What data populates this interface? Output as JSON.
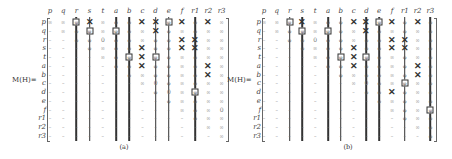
{
  "figure": {
    "matrix_label": "M(H)=",
    "columns": [
      "p",
      "q",
      "r",
      "s",
      "t",
      "a",
      "b",
      "c",
      "d",
      "e",
      "f",
      "r1",
      "r2",
      "r3"
    ],
    "rows": [
      "p",
      "q",
      "r",
      "s",
      "t",
      "a",
      "b",
      "c",
      "d",
      "e",
      "f",
      "r1",
      "r2",
      "r3"
    ],
    "symbols": {
      "infinity": "∞",
      "zero": "0",
      "dash": "–",
      "phi": "φ"
    },
    "panels": [
      {
        "id": "a",
        "caption": "(a)",
        "vertical_lines": [
          {
            "col": 2,
            "from_row": 0,
            "to_row": 13
          },
          {
            "col": 3,
            "from_row": 0,
            "to_row": 13
          },
          {
            "col": 5,
            "from_row": 0,
            "to_row": 13
          },
          {
            "col": 6,
            "from_row": 0,
            "to_row": 13
          },
          {
            "col": 8,
            "from_row": 0,
            "to_row": 13
          },
          {
            "col": 9,
            "from_row": 0,
            "to_row": 13
          },
          {
            "col": 11,
            "from_row": 0,
            "to_row": 13
          }
        ],
        "boxes": [
          {
            "row": 0,
            "col": 2
          },
          {
            "row": 1,
            "col": 3
          },
          {
            "row": 1,
            "col": 5
          },
          {
            "row": 0,
            "col": 9
          },
          {
            "row": 4,
            "col": 6
          },
          {
            "row": 4,
            "col": 8
          },
          {
            "row": 8,
            "col": 11
          }
        ],
        "crosses": [
          {
            "row": 0,
            "col": 3
          },
          {
            "row": 0,
            "col": 7
          },
          {
            "row": 0,
            "col": 8
          },
          {
            "row": 0,
            "col": 10
          },
          {
            "row": 0,
            "col": 12
          },
          {
            "row": 1,
            "col": 8
          },
          {
            "row": 2,
            "col": 10
          },
          {
            "row": 2,
            "col": 11
          },
          {
            "row": 3,
            "col": 7
          },
          {
            "row": 3,
            "col": 10
          },
          {
            "row": 3,
            "col": 11
          },
          {
            "row": 4,
            "col": 7
          },
          {
            "row": 5,
            "col": 7
          },
          {
            "row": 5,
            "col": 12
          },
          {
            "row": 6,
            "col": 12
          }
        ],
        "zeros": [
          {
            "row": 2,
            "col": 4
          },
          {
            "row": 7,
            "col": 8
          },
          {
            "row": 8,
            "col": 9
          },
          {
            "row": 10,
            "col": 13
          }
        ]
      },
      {
        "id": "b",
        "caption": "(b)",
        "vertical_lines": [
          {
            "col": 2,
            "from_row": 0,
            "to_row": 13
          },
          {
            "col": 3,
            "from_row": 0,
            "to_row": 13
          },
          {
            "col": 5,
            "from_row": 0,
            "to_row": 13
          },
          {
            "col": 6,
            "from_row": 0,
            "to_row": 13
          },
          {
            "col": 8,
            "from_row": 0,
            "to_row": 13
          },
          {
            "col": 9,
            "from_row": 0,
            "to_row": 13
          },
          {
            "col": 11,
            "from_row": 0,
            "to_row": 13
          },
          {
            "col": 13,
            "from_row": 0,
            "to_row": 13
          }
        ],
        "boxes": [
          {
            "row": 0,
            "col": 2
          },
          {
            "row": 1,
            "col": 3
          },
          {
            "row": 1,
            "col": 5
          },
          {
            "row": 0,
            "col": 9
          },
          {
            "row": 4,
            "col": 6
          },
          {
            "row": 4,
            "col": 8
          },
          {
            "row": 7,
            "col": 11
          },
          {
            "row": 10,
            "col": 13
          }
        ],
        "crosses": [
          {
            "row": 0,
            "col": 3
          },
          {
            "row": 0,
            "col": 7
          },
          {
            "row": 0,
            "col": 8
          },
          {
            "row": 0,
            "col": 10
          },
          {
            "row": 0,
            "col": 12
          },
          {
            "row": 1,
            "col": 8
          },
          {
            "row": 2,
            "col": 10
          },
          {
            "row": 2,
            "col": 11
          },
          {
            "row": 3,
            "col": 7
          },
          {
            "row": 3,
            "col": 10
          },
          {
            "row": 3,
            "col": 11
          },
          {
            "row": 4,
            "col": 7
          },
          {
            "row": 5,
            "col": 7
          },
          {
            "row": 5,
            "col": 12
          },
          {
            "row": 6,
            "col": 12
          },
          {
            "row": 8,
            "col": 10
          }
        ],
        "zeros": [
          {
            "row": 2,
            "col": 4
          },
          {
            "row": 7,
            "col": 8
          }
        ]
      }
    ]
  }
}
